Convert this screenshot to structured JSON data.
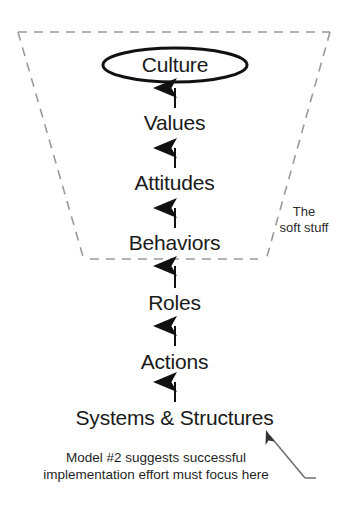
{
  "diagram": {
    "background_color": "#ffffff",
    "ink_color": "#1a1a1a",
    "dashed_color": "#9a9a9a",
    "top_node": {
      "label": "Culture",
      "shape": "ellipse"
    },
    "levels": [
      {
        "label": "Values"
      },
      {
        "label": "Attitudes"
      },
      {
        "label": "Behaviors"
      },
      {
        "label": "Roles"
      },
      {
        "label": "Actions"
      },
      {
        "label": "Systems & Structures"
      }
    ],
    "region_note": {
      "line1": "The",
      "line2": "soft stuff"
    },
    "caption": {
      "line1": "Model #2 suggests successful",
      "line2": "implementation effort must focus here"
    }
  }
}
